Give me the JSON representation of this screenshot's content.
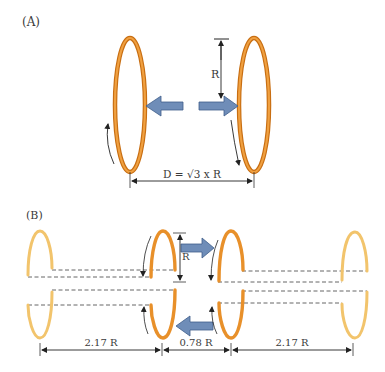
{
  "panel_a": {
    "label": "(A)",
    "radius_label": "R",
    "distance_label": "D = √3 x R"
  },
  "panel_b": {
    "label": "(B)",
    "radius_label": "R",
    "dimensions": [
      "2.17 R",
      "0.78 R",
      "2.17 R"
    ]
  },
  "colors": {
    "coil_dark": "#E8902A",
    "coil_light": "#F2C46C",
    "arrow_fill": "#6F8DB8",
    "arrow_stroke": "#3F5E8A",
    "line": "#333333",
    "dash": "#555555"
  }
}
